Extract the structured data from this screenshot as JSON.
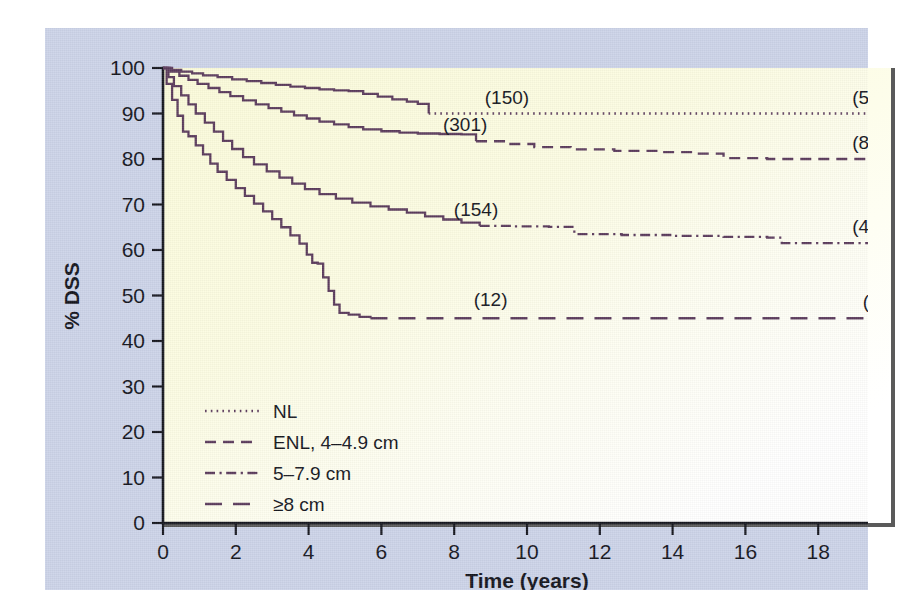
{
  "chart_data": {
    "type": "line",
    "title": "",
    "xlabel": "Time (years)",
    "ylabel": "% DSS",
    "xlim": [
      0,
      20
    ],
    "ylim": [
      0,
      100
    ],
    "xticks": [
      0,
      2,
      4,
      6,
      8,
      10,
      12,
      14,
      16,
      18,
      20
    ],
    "yticks": [
      0,
      10,
      20,
      30,
      40,
      50,
      60,
      70,
      80,
      90,
      100
    ],
    "grid": false,
    "legend_position": "lower-left-inside",
    "line_color": "#5b3b5c",
    "plot_background": "#fbfbd9",
    "mat_background": "#ccd3e8",
    "series": [
      {
        "name": "NL",
        "dash_style": "dotted",
        "annotation_mid": "(150)",
        "annotation_end": "(58)",
        "solid_until_x": 7.3,
        "final_value": 90,
        "points": [
          [
            0,
            100
          ],
          [
            0.25,
            99.6
          ],
          [
            0.5,
            99.2
          ],
          [
            0.8,
            98.8
          ],
          [
            1.1,
            98.4
          ],
          [
            1.5,
            98.0
          ],
          [
            1.9,
            97.5
          ],
          [
            2.3,
            97.1
          ],
          [
            2.7,
            96.7
          ],
          [
            3.1,
            96.3
          ],
          [
            3.5,
            95.9
          ],
          [
            3.9,
            95.6
          ],
          [
            4.3,
            95.3
          ],
          [
            4.7,
            95.1
          ],
          [
            5.1,
            94.9
          ],
          [
            5.5,
            94.3
          ],
          [
            5.9,
            93.7
          ],
          [
            6.3,
            93.1
          ],
          [
            6.7,
            92.6
          ],
          [
            7.0,
            92.1
          ],
          [
            7.3,
            90.0
          ],
          [
            20,
            90.0
          ]
        ]
      },
      {
        "name": "ENL, 4–4.9 cm",
        "dash_style": "dashed",
        "annotation_mid": "(301)",
        "annotation_end": "(88)",
        "solid_until_x": 8.6,
        "final_value": 80,
        "points": [
          [
            0,
            100
          ],
          [
            0.2,
            99.2
          ],
          [
            0.45,
            98.3
          ],
          [
            0.7,
            97.4
          ],
          [
            0.95,
            96.5
          ],
          [
            1.25,
            95.6
          ],
          [
            1.55,
            94.7
          ],
          [
            1.85,
            93.8
          ],
          [
            2.2,
            92.9
          ],
          [
            2.55,
            92.0
          ],
          [
            2.9,
            91.2
          ],
          [
            3.25,
            90.4
          ],
          [
            3.6,
            89.6
          ],
          [
            3.95,
            88.9
          ],
          [
            4.3,
            88.2
          ],
          [
            4.7,
            87.6
          ],
          [
            5.1,
            87.0
          ],
          [
            5.5,
            86.5
          ],
          [
            6.0,
            86.1
          ],
          [
            6.5,
            85.8
          ],
          [
            7.0,
            85.6
          ],
          [
            7.6,
            85.5
          ],
          [
            8.2,
            85.4
          ],
          [
            8.6,
            83.9
          ],
          [
            9.4,
            83.3
          ],
          [
            10.2,
            82.6
          ],
          [
            11.2,
            82.1
          ],
          [
            12.4,
            81.8
          ],
          [
            13.6,
            81.5
          ],
          [
            14.6,
            81.2
          ],
          [
            15.4,
            80.2
          ],
          [
            16.6,
            80.0
          ],
          [
            20,
            80.0
          ]
        ]
      },
      {
        "name": "5–7.9 cm",
        "dash_style": "dashdot",
        "annotation_mid": "(154)",
        "annotation_end": "(48)",
        "solid_until_x": 8.7,
        "final_value": 61.5,
        "points": [
          [
            0,
            100
          ],
          [
            0.15,
            98.0
          ],
          [
            0.3,
            96.0
          ],
          [
            0.5,
            94.0
          ],
          [
            0.7,
            92.0
          ],
          [
            0.9,
            90.0
          ],
          [
            1.15,
            88.0
          ],
          [
            1.4,
            86.0
          ],
          [
            1.65,
            84.0
          ],
          [
            1.9,
            82.2
          ],
          [
            2.2,
            80.4
          ],
          [
            2.5,
            78.8
          ],
          [
            2.85,
            77.3
          ],
          [
            3.2,
            75.9
          ],
          [
            3.55,
            74.6
          ],
          [
            3.9,
            73.4
          ],
          [
            4.3,
            72.3
          ],
          [
            4.75,
            71.3
          ],
          [
            5.2,
            70.4
          ],
          [
            5.7,
            69.6
          ],
          [
            6.2,
            68.9
          ],
          [
            6.7,
            68.2
          ],
          [
            7.2,
            67.4
          ],
          [
            7.7,
            66.7
          ],
          [
            8.2,
            66.0
          ],
          [
            8.7,
            65.3
          ],
          [
            9.6,
            65.2
          ],
          [
            10.6,
            65.1
          ],
          [
            11.3,
            63.5
          ],
          [
            12.6,
            63.3
          ],
          [
            14.0,
            63.1
          ],
          [
            15.4,
            62.9
          ],
          [
            16.6,
            62.7
          ],
          [
            17.0,
            61.5
          ],
          [
            20,
            61.5
          ]
        ]
      },
      {
        "name": "≥8 cm",
        "dash_style": "longdash",
        "annotation_mid": "(12)",
        "annotation_end": "(4)",
        "solid_until_x": 5.7,
        "final_value": 45,
        "points": [
          [
            0,
            100
          ],
          [
            0.1,
            96.5
          ],
          [
            0.25,
            93.0
          ],
          [
            0.4,
            89.5
          ],
          [
            0.55,
            86.0
          ],
          [
            0.7,
            85.0
          ],
          [
            0.9,
            83.0
          ],
          [
            1.1,
            81.0
          ],
          [
            1.3,
            79.0
          ],
          [
            1.5,
            77.2
          ],
          [
            1.75,
            75.4
          ],
          [
            2.0,
            73.6
          ],
          [
            2.25,
            71.9
          ],
          [
            2.5,
            70.2
          ],
          [
            2.75,
            68.5
          ],
          [
            3.0,
            66.8
          ],
          [
            3.25,
            65.0
          ],
          [
            3.5,
            63.2
          ],
          [
            3.75,
            61.4
          ],
          [
            3.95,
            59.0
          ],
          [
            4.1,
            57.2
          ],
          [
            4.25,
            57.0
          ],
          [
            4.4,
            54.0
          ],
          [
            4.55,
            51.0
          ],
          [
            4.7,
            48.0
          ],
          [
            4.85,
            46.2
          ],
          [
            5.1,
            45.8
          ],
          [
            5.4,
            45.3
          ],
          [
            5.7,
            45.0
          ],
          [
            20,
            45.0
          ]
        ]
      }
    ]
  },
  "legend": {
    "items": [
      {
        "label": "NL",
        "dash_style": "dotted"
      },
      {
        "label": "ENL, 4–4.9 cm",
        "dash_style": "dashed"
      },
      {
        "label": "5–7.9 cm",
        "dash_style": "dashdot"
      },
      {
        "label": "≥8 cm",
        "dash_style": "longdash"
      }
    ]
  },
  "axes": {
    "y_title": "% DSS",
    "x_title": "Time (years)",
    "x_tick_labels": [
      "0",
      "2",
      "4",
      "6",
      "8",
      "10",
      "12",
      "14",
      "16",
      "18",
      "20"
    ],
    "y_tick_labels": [
      "0",
      "10",
      "20",
      "30",
      "40",
      "50",
      "60",
      "70",
      "80",
      "90",
      "100"
    ]
  },
  "annotations": {
    "nl_mid": "(150)",
    "nl_end": "(58)",
    "enl4_mid": "(301)",
    "enl4_end": "(88)",
    "enl5_mid": "(154)",
    "enl5_end": "(48)",
    "enl8_mid": "(12)",
    "enl8_end": "(4)"
  }
}
